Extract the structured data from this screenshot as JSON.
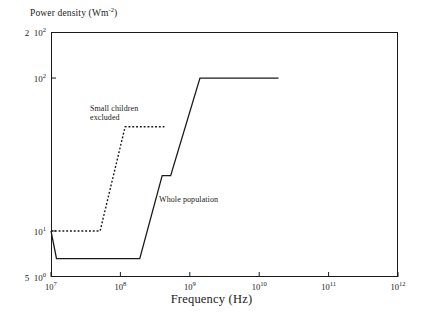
{
  "chart_data": {
    "type": "line",
    "title": "",
    "ylabel": "Power density (Wm⁻²)",
    "xlabel": "Frequency (Hz)",
    "xscale": "log",
    "yscale": "log",
    "xlim": [
      10000000,
      1000000000000
    ],
    "ylim": [
      5,
      200
    ],
    "grid": false,
    "legend_position": "inline-annotations",
    "xticks": [
      {
        "value": 10000000,
        "label": "10",
        "exp": "7"
      },
      {
        "value": 100000000,
        "label": "10",
        "exp": "8"
      },
      {
        "value": 1000000000,
        "label": "10",
        "exp": "9"
      },
      {
        "value": 10000000000,
        "label": "10",
        "exp": "10"
      },
      {
        "value": 100000000000,
        "label": "10",
        "exp": "11"
      },
      {
        "value": 1000000000000,
        "label": "10",
        "exp": "12"
      }
    ],
    "yticks": [
      {
        "value": 200,
        "prefix": "2",
        "label": "10",
        "exp": "2"
      },
      {
        "value": 100,
        "prefix": "",
        "label": "10",
        "exp": "2"
      },
      {
        "value": 10,
        "prefix": "",
        "label": "10",
        "exp": "1"
      },
      {
        "value": 5,
        "prefix": "5",
        "label": "10",
        "exp": "0"
      }
    ],
    "series": [
      {
        "name": "Whole population",
        "style": "solid",
        "color": "#1a1a1a",
        "points": [
          [
            10000000,
            10
          ],
          [
            12000000,
            6.6
          ],
          [
            190000000,
            6.6
          ],
          [
            400000000,
            23
          ],
          [
            530000000,
            23
          ],
          [
            1400000000,
            100
          ],
          [
            19000000000,
            100
          ]
        ]
      },
      {
        "name": "Small children excluded",
        "style": "dotted",
        "color": "#1a1a1a",
        "points": [
          [
            10000000,
            10
          ],
          [
            51000000,
            10
          ],
          [
            117000000,
            48
          ],
          [
            430000000,
            48
          ]
        ]
      }
    ],
    "annotations": [
      {
        "text": "Small children\nexcluded",
        "x": 90,
        "y": 105
      },
      {
        "text": "Whole population",
        "x": 159,
        "y": 196
      }
    ]
  }
}
